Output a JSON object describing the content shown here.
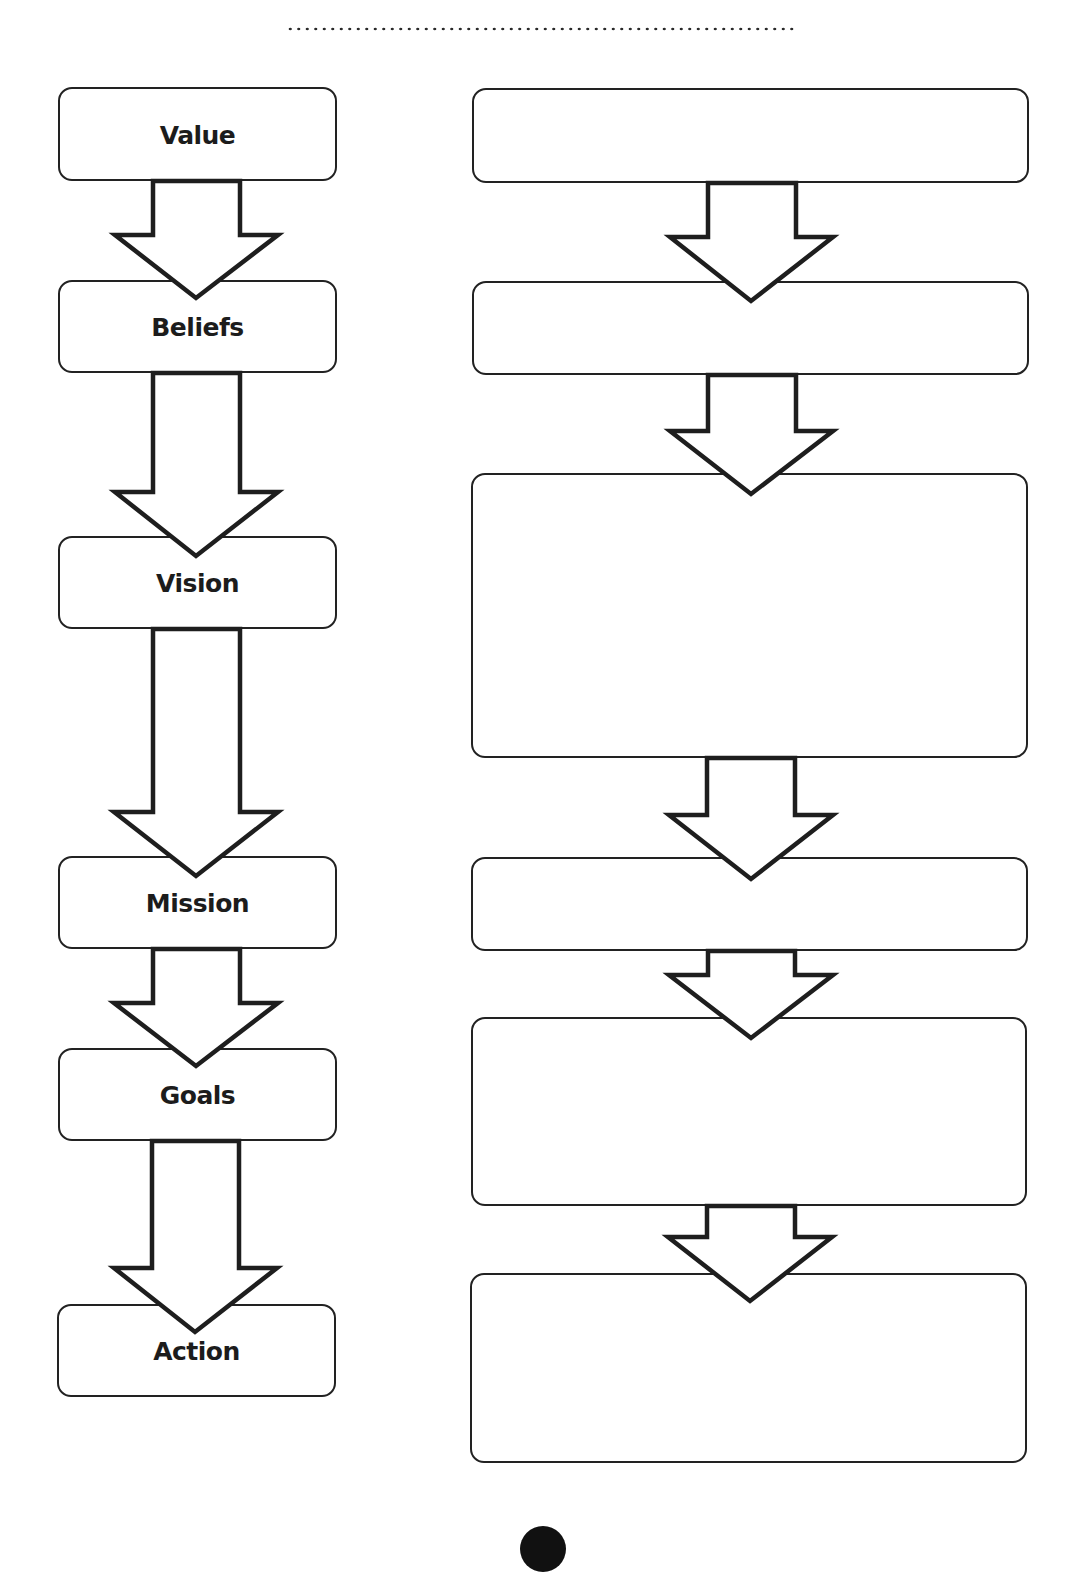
{
  "page": {
    "width": 1087,
    "height": 1536,
    "background": "#ffffff",
    "stroke_color": "#222222"
  },
  "header": {
    "dotted_rule": true
  },
  "left_column": {
    "boxes": [
      {
        "label": "Value"
      },
      {
        "label": "Beliefs"
      },
      {
        "label": "Vision"
      },
      {
        "label": "Mission"
      },
      {
        "label": "Goals"
      },
      {
        "label": "Action"
      }
    ]
  },
  "right_column": {
    "boxes": [
      {
        "label": ""
      },
      {
        "label": ""
      },
      {
        "label": ""
      },
      {
        "label": ""
      },
      {
        "label": ""
      },
      {
        "label": ""
      }
    ]
  },
  "arrows": {
    "icon": "down-arrow-icon",
    "left_count": 5,
    "right_count": 5
  }
}
